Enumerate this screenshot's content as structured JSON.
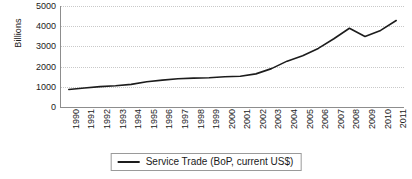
{
  "chart_data": {
    "type": "line",
    "title": "",
    "xlabel": "",
    "ylabel": "Billions",
    "ylim": [
      0,
      5000
    ],
    "y_ticks": [
      0,
      1000,
      2000,
      3000,
      4000,
      5000
    ],
    "grid": true,
    "legend_position": "bottom",
    "categories": [
      "1990",
      "1991",
      "1992",
      "1993",
      "1994",
      "1995",
      "1996",
      "1997",
      "1998",
      "1999",
      "2000",
      "2001",
      "2002",
      "2003",
      "2004",
      "2005",
      "2006",
      "2007",
      "2008",
      "2009",
      "2010",
      "2011"
    ],
    "series": [
      {
        "name": "Service Trade (BoP, current US$)",
        "color": "#1c1c1c",
        "values": [
          870,
          940,
          1010,
          1050,
          1120,
          1250,
          1330,
          1400,
          1430,
          1450,
          1500,
          1520,
          1640,
          1900,
          2270,
          2540,
          2900,
          3380,
          3900,
          3490,
          3790,
          4280
        ]
      }
    ]
  },
  "axes": {
    "y_axis_title": "Billions",
    "y_tick_labels": [
      "5000",
      "4000",
      "3000",
      "2000",
      "1000",
      "0"
    ],
    "x_tick_labels": [
      "1990",
      "1991",
      "1992",
      "1993",
      "1994",
      "1995",
      "1996",
      "1997",
      "1998",
      "1999",
      "2000",
      "2001",
      "2002",
      "2003",
      "2004",
      "2005",
      "2006",
      "2007",
      "2008",
      "2009",
      "2010",
      "2011"
    ]
  },
  "legend": {
    "entries": [
      {
        "label": "Service Trade (BoP, current US$)",
        "marker": "line-swatch"
      }
    ]
  },
  "colors": {
    "series_line": "#1c1c1c",
    "axis": "#8d8d8d",
    "gridline": "#c9c9c9",
    "text": "#1a1a1a",
    "background": "#ffffff"
  }
}
